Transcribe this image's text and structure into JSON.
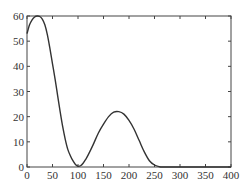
{
  "chart_data": {
    "type": "line",
    "title": "",
    "xlabel": "",
    "ylabel": "",
    "xlim": [
      0,
      400
    ],
    "ylim": [
      0,
      60
    ],
    "grid": false,
    "legend": null,
    "x_ticks": [
      0,
      50,
      100,
      150,
      200,
      250,
      300,
      350,
      400
    ],
    "y_ticks": [
      0,
      10,
      20,
      30,
      40,
      50,
      60
    ],
    "series": [
      {
        "name": "curve",
        "color": "#333333",
        "x": [
          0,
          5,
          10,
          15,
          20,
          25,
          30,
          35,
          40,
          45,
          50,
          55,
          60,
          65,
          70,
          75,
          80,
          85,
          90,
          95,
          100,
          105,
          110,
          115,
          120,
          130,
          140,
          150,
          160,
          170,
          180,
          190,
          200,
          210,
          220,
          230,
          240,
          250,
          260,
          265,
          270,
          300,
          350,
          400
        ],
        "values": [
          53,
          56.5,
          58.5,
          59.6,
          60,
          59.8,
          58.8,
          56.5,
          52.5,
          47,
          41,
          35,
          28.5,
          22,
          16,
          11,
          7,
          4.5,
          2.5,
          1,
          0.3,
          0.5,
          1.5,
          3,
          4.8,
          9,
          13.5,
          17,
          20,
          21.8,
          22,
          21,
          18.5,
          15,
          10.5,
          6,
          2.5,
          0.8,
          0.1,
          0,
          0,
          0,
          0,
          0
        ]
      }
    ]
  },
  "axes": {
    "x_tick_labels": [
      "0",
      "50",
      "100",
      "150",
      "200",
      "250",
      "300",
      "350",
      "400"
    ],
    "y_tick_labels": [
      "0",
      "10",
      "20",
      "30",
      "40",
      "50",
      "60"
    ]
  }
}
